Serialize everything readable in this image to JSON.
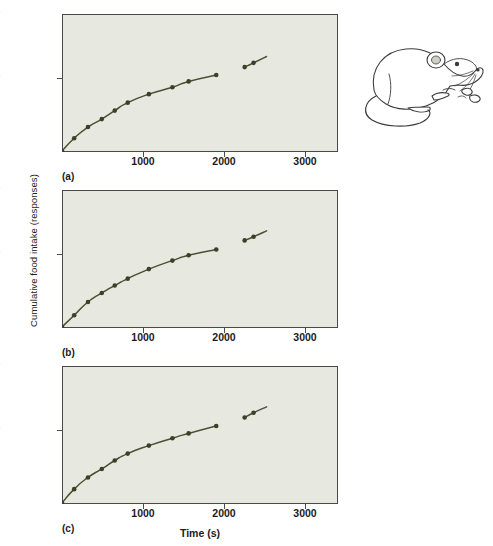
{
  "figure": {
    "ylabel": "Cumulative food intake (responses)",
    "xlabel": "Time (s)",
    "illustration_name": "laboratory-rat-eating-pellets"
  },
  "axes": {
    "y_ticks": [
      "240",
      "120"
    ],
    "x_ticks": [
      "1000",
      "2000",
      "3000"
    ]
  },
  "panels": [
    {
      "key": "a",
      "label": "(a)"
    },
    {
      "key": "b",
      "label": "(b)"
    },
    {
      "key": "c",
      "label": "(c)"
    }
  ],
  "style": {
    "plot_background": "#e7e8e0",
    "axis_color": "#4a4a46",
    "line_color": "#4b5033",
    "marker_color": "#3c4029",
    "page_background": "#ffffff"
  },
  "chart_data": [
    {
      "type": "line",
      "panel": "a",
      "title": "(a)",
      "xlabel": "Time (s)",
      "ylabel": "Cumulative food intake (responses)",
      "xlim": [
        0,
        3400
      ],
      "ylim": [
        0,
        260
      ],
      "x_ticks": [
        1000,
        2000,
        3000
      ],
      "y_ticks": [
        120,
        240
      ],
      "grid": false,
      "legend": "none",
      "note": "Curve is interrupted by a gap between about 1900 s and 2250 s",
      "series": [
        {
          "name": "segment-1",
          "x": [
            0,
            150,
            320,
            490,
            650,
            810,
            1070,
            1360,
            1560,
            1900
          ],
          "y": [
            2,
            26,
            47,
            62,
            78,
            93,
            109,
            122,
            133,
            145
          ]
        },
        {
          "name": "segment-2",
          "x": [
            2250,
            2360,
            2520
          ],
          "y": [
            160,
            168,
            180
          ]
        }
      ]
    },
    {
      "type": "line",
      "panel": "b",
      "title": "(b)",
      "xlabel": "Time (s)",
      "ylabel": "Cumulative food intake (responses)",
      "xlim": [
        0,
        3400
      ],
      "ylim": [
        0,
        260
      ],
      "x_ticks": [
        1000,
        2000,
        3000
      ],
      "y_ticks": [
        120,
        240
      ],
      "grid": false,
      "legend": "none",
      "note": "More strongly decelerating (negatively accelerated) curve; gap between about 1900 s and 2250 s",
      "series": [
        {
          "name": "segment-1",
          "x": [
            0,
            150,
            320,
            490,
            650,
            810,
            1070,
            1360,
            1560,
            1900
          ],
          "y": [
            2,
            24,
            49,
            66,
            80,
            93,
            111,
            127,
            137,
            148
          ]
        },
        {
          "name": "segment-2",
          "x": [
            2250,
            2360,
            2520
          ],
          "y": [
            165,
            172,
            183
          ]
        }
      ]
    },
    {
      "type": "line",
      "panel": "c",
      "title": "(c)",
      "xlabel": "Time (s)",
      "ylabel": "Cumulative food intake (responses)",
      "xlim": [
        0,
        3400
      ],
      "ylim": [
        0,
        260
      ],
      "x_ticks": [
        1000,
        2000,
        3000
      ],
      "y_ticks": [
        120,
        240
      ],
      "grid": false,
      "legend": "none",
      "note": "Stepwise, scalloped cumulative curve with pauses; gap between about 1900 s and 2250 s",
      "series": [
        {
          "name": "segment-1",
          "x": [
            0,
            150,
            320,
            490,
            650,
            810,
            1070,
            1360,
            1560,
            1900
          ],
          "y": [
            2,
            28,
            50,
            66,
            82,
            95,
            110,
            124,
            133,
            147
          ]
        },
        {
          "name": "segment-2",
          "x": [
            2250,
            2360,
            2520
          ],
          "y": [
            163,
            172,
            183
          ]
        }
      ]
    }
  ]
}
